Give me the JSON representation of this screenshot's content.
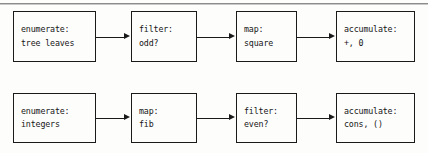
{
  "figure": {
    "background_color": "#fdfdfc",
    "line_color": "#1a1a1a",
    "rule_color": "#8c8c8c"
  },
  "rows": [
    {
      "name": "sum-odd-squares-signal-flow",
      "nodes": [
        {
          "stage": "enumerate",
          "label_line1": "enumerate:",
          "label_line2": "tree leaves"
        },
        {
          "stage": "filter",
          "label_line1": "filter:",
          "label_line2": "odd?"
        },
        {
          "stage": "map",
          "label_line1": "map:",
          "label_line2": "square"
        },
        {
          "stage": "accumulate",
          "label_line1": "accumulate:",
          "label_line2": "+, 0"
        }
      ]
    },
    {
      "name": "even-fibs-signal-flow",
      "nodes": [
        {
          "stage": "enumerate",
          "label_line1": "enumerate:",
          "label_line2": "integers"
        },
        {
          "stage": "map",
          "label_line1": "map:",
          "label_line2": "fib"
        },
        {
          "stage": "filter",
          "label_line1": "filter:",
          "label_line2": "even?"
        },
        {
          "stage": "accumulate",
          "label_line1": "accumulate:",
          "label_line2": "cons, ()"
        }
      ]
    }
  ],
  "connectors": {
    "arrow_icon": "arrow-right-icon",
    "count_per_row": 3
  }
}
